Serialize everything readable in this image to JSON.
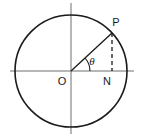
{
  "figure": {
    "background_color": "#ffffff",
    "stroke_color": "#1a1a1a",
    "axis_color": "#6e6e6e",
    "labels": {
      "point_p": "P",
      "origin_o": "O",
      "foot_n": "N",
      "angle_theta": "θ"
    },
    "geometry": {
      "center_x": 71,
      "center_y": 71,
      "radius": 56,
      "point_p_x": 112,
      "point_p_y": 33,
      "foot_n_x": 112,
      "foot_n_y": 71,
      "angle_arc_radius": 19,
      "angle_degrees": 43,
      "h_axis_x1": 10,
      "h_axis_x2": 134,
      "v_axis_y1": 3,
      "v_axis_y2": 134,
      "dashed_pattern": "4 3"
    },
    "label_positions": {
      "point_p": {
        "x": 116,
        "y": 26
      },
      "origin_o": {
        "x": 62,
        "y": 85
      },
      "foot_n": {
        "x": 107,
        "y": 85
      },
      "angle_theta": {
        "x": 92,
        "y": 65
      }
    },
    "elements": {
      "circle_name": "unit-circle",
      "radius_line_name": "radius-line-op",
      "dashed_line_name": "perpendicular-line-pn",
      "angle_arc_name": "angle-arc"
    }
  }
}
